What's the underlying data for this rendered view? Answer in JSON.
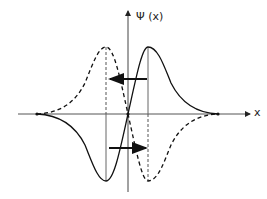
{
  "diagram": {
    "y_axis_label": "Ψ (x)",
    "x_axis_label": "x",
    "curves": [
      {
        "name": "wavefunction-solid",
        "style": "solid",
        "shape": "antisymmetric, negative lobe left, positive lobe right"
      },
      {
        "name": "wavefunction-dashed",
        "style": "dashed",
        "shape": "antisymmetric, positive lobe left, negative lobe right"
      }
    ],
    "arrows": [
      {
        "name": "upper-arrow",
        "direction": "left"
      },
      {
        "name": "lower-arrow",
        "direction": "right"
      }
    ],
    "colors": {
      "line": "#111111",
      "axis": "#555555",
      "background": "#ffffff"
    }
  }
}
